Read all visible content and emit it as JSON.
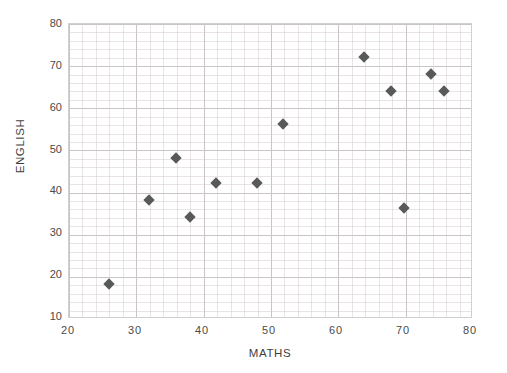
{
  "chart_data": {
    "type": "scatter",
    "title": "",
    "xlabel": "MATHS",
    "ylabel": "ENGLISH",
    "xlim": [
      20,
      80
    ],
    "ylim": [
      10,
      80
    ],
    "xticks": [
      "20",
      "30",
      "40",
      "50",
      "60",
      "70",
      "80"
    ],
    "yticks": [
      "10",
      "20",
      "30",
      "40",
      "50",
      "60",
      "70",
      "80"
    ],
    "xtick_values": [
      20,
      30,
      40,
      50,
      60,
      70,
      80
    ],
    "ytick_values": [
      10,
      20,
      30,
      40,
      50,
      60,
      70,
      80
    ],
    "x_minor_step": 2,
    "y_minor_step": 2,
    "grid": true,
    "legend": false,
    "marker": "diamond",
    "marker_color": "#595959",
    "points": [
      {
        "x": 26,
        "y": 18
      },
      {
        "x": 32,
        "y": 38
      },
      {
        "x": 36,
        "y": 48
      },
      {
        "x": 38,
        "y": 34
      },
      {
        "x": 42,
        "y": 42
      },
      {
        "x": 48,
        "y": 42
      },
      {
        "x": 52,
        "y": 56
      },
      {
        "x": 64,
        "y": 72
      },
      {
        "x": 68,
        "y": 64
      },
      {
        "x": 70,
        "y": 36
      },
      {
        "x": 74,
        "y": 68
      },
      {
        "x": 76,
        "y": 64
      }
    ]
  }
}
